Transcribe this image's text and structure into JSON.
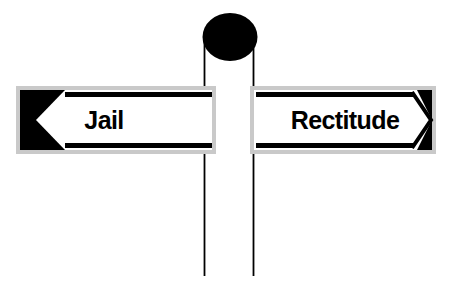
{
  "illustration": {
    "title": "signpost-with-two-direction-signs",
    "background_color": "#ffffff",
    "ink_color": "#000000",
    "shadow_color": "#c8c8c8",
    "face_color": "#ffffff"
  },
  "post": {
    "name": "sign-post",
    "left_edge_x": 204,
    "right_edge_x": 253,
    "top_y": 36,
    "bottom_y": 276,
    "stroke_color": "#000000",
    "stroke_width": 1.6
  },
  "finial": {
    "name": "post-finial-ellipse",
    "shape": "ellipse",
    "center_x": 230,
    "center_y": 37,
    "radius_x": 27,
    "radius_y": 24,
    "fill": "#000000"
  },
  "signs": [
    {
      "id": "left-sign",
      "label": "Jail",
      "direction": "left",
      "arrow_icon": "chevron-left-icon",
      "x": 16,
      "y": 86,
      "width": 200,
      "height": 68,
      "label_x": 104,
      "label_y": 128,
      "label_anchor": "middle",
      "shadow_offset_x": 4,
      "shadow_offset_y": 5
    },
    {
      "id": "right-sign",
      "label": "Rectitude",
      "direction": "right",
      "arrow_icon": "chevron-right-icon",
      "x": 250,
      "y": 86,
      "width": 186,
      "height": 68,
      "label_x": 345,
      "label_y": 128,
      "label_anchor": "middle",
      "shadow_offset_x": 4,
      "shadow_offset_y": 5
    }
  ],
  "rules": {
    "top_rule_label": "top-edge-rule",
    "bottom_rule_label": "bottom-edge-rule",
    "thickness": 5
  }
}
